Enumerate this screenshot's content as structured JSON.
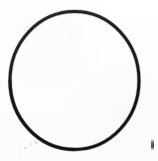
{
  "figure": {
    "background_color": "#fdfdfc",
    "stroke_color": "#231f1e",
    "fill_color": "none",
    "canvas": {
      "width": 158,
      "height": 161
    }
  },
  "shapes": [
    {
      "name": "circle-outline",
      "type": "ellipse",
      "center_x": 74.5,
      "center_y": 80.5,
      "radius_x": 64.5,
      "radius_y": 69.0,
      "stroke_width": 3.0,
      "stroke_color": "#231f1e",
      "fill": "none"
    }
  ],
  "artifacts": {
    "edge_mark": {
      "name": "edge-mark",
      "x": 151,
      "y": 139,
      "width": 3,
      "height": 11,
      "color": "#282624"
    },
    "specks": [
      {
        "x": 24,
        "y": 147
      },
      {
        "x": 30,
        "y": 143
      },
      {
        "x": 34,
        "y": 141
      },
      {
        "x": 19,
        "y": 151
      },
      {
        "x": 71,
        "y": 34
      }
    ]
  },
  "chart_data": {
    "type": "diagram",
    "xlabel": "",
    "ylabel": "",
    "elements": [
      "circle-outline"
    ]
  }
}
